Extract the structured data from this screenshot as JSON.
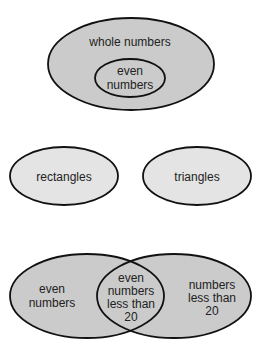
{
  "colors": {
    "dark_fill": "#cbcbcb",
    "light_fill": "#e4e4e4",
    "stroke": "#111111",
    "text": "#222222"
  },
  "diagrams": [
    {
      "type": "nested",
      "outer": {
        "label": "whole numbers"
      },
      "inner": {
        "lines": [
          "even",
          "numbers"
        ]
      }
    },
    {
      "type": "disjoint",
      "sets": [
        {
          "label": "rectangles"
        },
        {
          "label": "triangles"
        }
      ]
    },
    {
      "type": "overlapping",
      "left": {
        "lines": [
          "even",
          "numbers"
        ]
      },
      "intersection": {
        "lines": [
          "even",
          "numbers",
          "less than",
          "20"
        ]
      },
      "right": {
        "lines": [
          "numbers",
          "less than",
          "20"
        ]
      }
    }
  ]
}
